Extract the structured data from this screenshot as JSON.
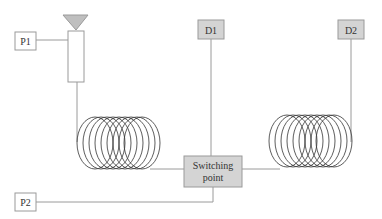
{
  "diagram": {
    "labels": {
      "p1": "P1",
      "p2": "P2",
      "d1": "D1",
      "d2": "D2",
      "switch_line1": "Switching",
      "switch_line2": "point"
    },
    "colors": {
      "line": "#9a9a9a",
      "box_fill_gray": "#d4d4d4",
      "box_fill_white": "#ffffff",
      "box_stroke": "#9a9a9a",
      "triangle_fill": "#bfbfbf",
      "coil": "#333333",
      "text": "#333333"
    },
    "nodes": [
      {
        "id": "p1",
        "type": "port-box",
        "label": "P1"
      },
      {
        "id": "p2",
        "type": "port-box",
        "label": "P2"
      },
      {
        "id": "d1",
        "type": "detector-box",
        "label": "D1"
      },
      {
        "id": "d2",
        "type": "detector-box",
        "label": "D2"
      },
      {
        "id": "switch",
        "type": "switch-box",
        "label": "Switching point"
      },
      {
        "id": "source",
        "type": "triangle-tube"
      },
      {
        "id": "coil1",
        "type": "fiber-coil"
      },
      {
        "id": "coil2",
        "type": "fiber-coil"
      }
    ]
  }
}
